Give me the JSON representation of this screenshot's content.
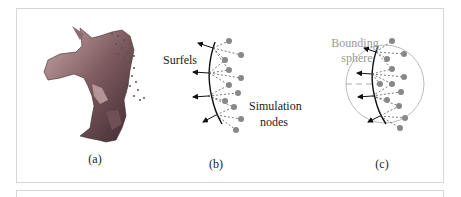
{
  "figure": {
    "panels": [
      {
        "id": "a",
        "caption": "(a)"
      },
      {
        "id": "b",
        "caption": "(b)",
        "labels": {
          "surfels": "Surfels",
          "nodes_line1": "Simulation",
          "nodes_line2": "nodes"
        }
      },
      {
        "id": "c",
        "caption": "(c)",
        "labels": {
          "bounding_line1": "Bounding",
          "bounding_line2": "sphere"
        }
      }
    ],
    "colors": {
      "node": "#888888",
      "surfel": "#111111",
      "sphere": "#aaaaaa",
      "label_gray": "#999999",
      "frame": "#d6d6d6"
    }
  }
}
